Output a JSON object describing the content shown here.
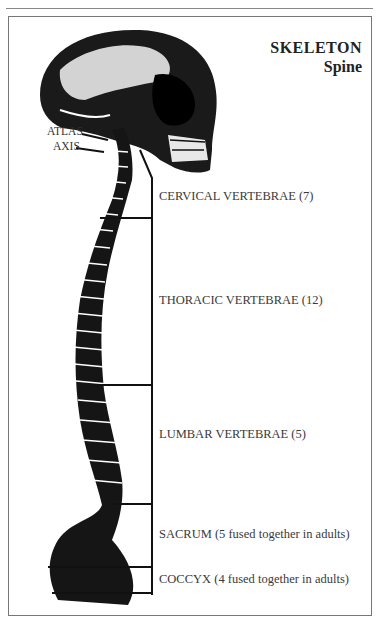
{
  "title": {
    "main": "SKELETON",
    "sub": "Spine"
  },
  "labels": {
    "atlas": "ATLAS",
    "axis": "AXIS",
    "sections": [
      {
        "name": "CERVICAL VERTEBRAE (7)"
      },
      {
        "name": "THORACIC VERTEBRAE (12)"
      },
      {
        "name": "LUMBAR VERTEBRAE (5)"
      },
      {
        "name": "SACRUM (5 fused together in adults)"
      },
      {
        "name": "COCCYX (4 fused together in adults)"
      }
    ]
  },
  "illustration": {
    "subject": "skull-and-spine-side-view"
  }
}
